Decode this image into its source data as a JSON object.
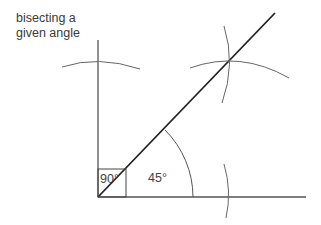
{
  "title": {
    "line1": "bisecting a",
    "line2": "given angle"
  },
  "labels": {
    "right_angle": "90°",
    "half_angle": "45°"
  },
  "colors": {
    "line": "#222222",
    "construction": "#666666",
    "text": "#444444"
  }
}
